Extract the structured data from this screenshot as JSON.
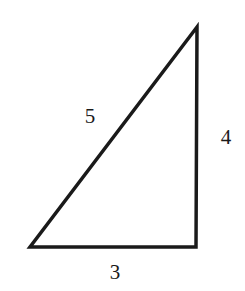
{
  "diagram": {
    "type": "right-triangle",
    "stroke_color": "#1a1a1a",
    "background": "#ffffff",
    "vertices": {
      "top": [
        197,
        27
      ],
      "bottom_left": [
        30,
        247
      ],
      "bottom_right": [
        196,
        247
      ]
    },
    "labels": {
      "hypotenuse": "5",
      "vertical_leg": "4",
      "horizontal_leg": "3"
    },
    "label_positions": {
      "hypotenuse": [
        90,
        116
      ],
      "vertical_leg": [
        226,
        137
      ],
      "horizontal_leg": [
        115,
        272
      ]
    }
  }
}
